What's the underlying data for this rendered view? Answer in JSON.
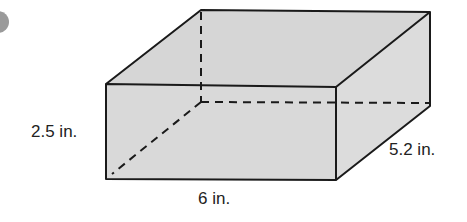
{
  "figure": {
    "type": "rectangular prism",
    "labels": {
      "height": "2.5 in.",
      "length": "6 in.",
      "width": "5.2 in."
    },
    "colors": {
      "face_fill": "#d9d9d9",
      "edge": "#1a1a1a",
      "badge": "#9a9a9a"
    }
  }
}
